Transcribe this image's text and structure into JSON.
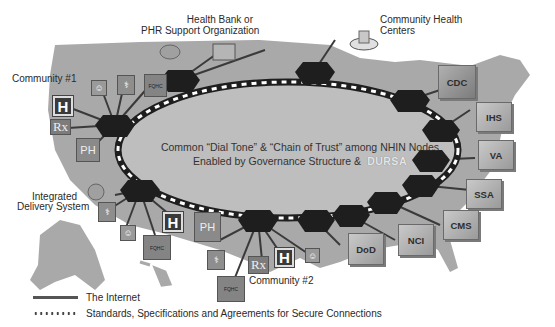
{
  "diagram": {
    "title_center": {
      "line1": "Common “Dial Tone” & “Chain of Trust” among NHIN Nodes",
      "line2": "Enabled by Governance Structure &",
      "dursa": "DURSA"
    },
    "labels": {
      "health_bank": "Health Bank or",
      "health_bank_2": "PHR Support Organization",
      "chc": "Community Health",
      "chc_2": "Centers",
      "community1": "Community #1",
      "community2": "Community #2",
      "ids": "Integrated",
      "ids_2": "Delivery System"
    },
    "icons": {
      "hospital": "H",
      "public_health": "PH",
      "pharmacy": "Rx",
      "fqhc": "FQHC",
      "doctor": "⚕",
      "person": "☺"
    },
    "agencies": [
      "CDC",
      "IHS",
      "VA",
      "SSA",
      "CMS",
      "NCI",
      "DoD"
    ],
    "legend": [
      {
        "symbol": "solid-line",
        "label": "The Internet"
      },
      {
        "symbol": "dotted-line",
        "label": "Standards, Specifications and Agreements for Secure Connections"
      }
    ],
    "colors": {
      "map": "#a8a8a8",
      "ellipse": "#bdbdbd",
      "node": "#1e1e1e",
      "background": "#ffffff"
    }
  }
}
